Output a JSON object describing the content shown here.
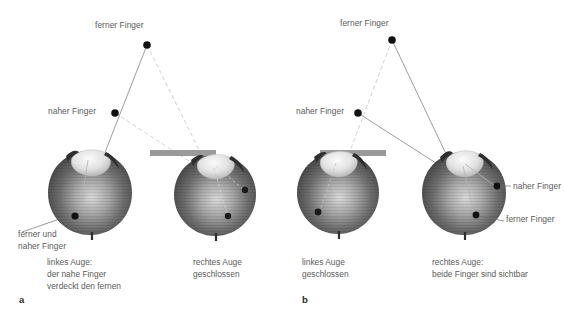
{
  "figure": {
    "background_color": "#ffffff",
    "text_color": "#5b5b5b",
    "letter_color": "#2b2b2b",
    "solid_ray_color": "#8a8a8a",
    "dashed_ray_color": "#c9c9c9",
    "occluder_color": "#9a9a9a",
    "point_color": "#111111"
  },
  "panels": [
    {
      "id": "a",
      "letter": "a",
      "labels": {
        "far_finger": "ferner Finger",
        "near_finger": "naher Finger",
        "retina_note": "ferner und\nnaher Finger"
      },
      "captions": {
        "left_eye": "linkes Auge:\nder nahe Finger\nverdeckt den fernen",
        "right_eye": "rechtes Auge\ngeschlossen"
      },
      "points": {
        "far_finger": {
          "x": 147,
          "y": 45
        },
        "near_finger": {
          "x": 115,
          "y": 113
        }
      },
      "eyes": [
        {
          "name": "left-eye",
          "state": "open",
          "cx": 90,
          "cy": 193
        },
        {
          "name": "right-eye",
          "state": "closed",
          "cx": 215,
          "cy": 195
        }
      ],
      "occluder": {
        "x": 150,
        "y": 150,
        "width": 66,
        "height": 6
      }
    },
    {
      "id": "b",
      "letter": "b",
      "labels": {
        "far_finger": "ferner Finger",
        "near_finger": "naher Finger",
        "retina_near": "naher Finger",
        "retina_far": "ferner Finger"
      },
      "captions": {
        "left_eye": "linkes Auge\ngeschlossen",
        "right_eye": "rechtes Auge:\nbeide Finger sind sichtbar"
      },
      "points": {
        "far_finger": {
          "x": 392,
          "y": 40
        },
        "near_finger": {
          "x": 358,
          "y": 113
        }
      },
      "eyes": [
        {
          "name": "left-eye",
          "state": "closed",
          "cx": 338,
          "cy": 193
        },
        {
          "name": "right-eye",
          "state": "open",
          "cx": 464,
          "cy": 193
        }
      ],
      "occluder": {
        "x": 320,
        "y": 150,
        "width": 66,
        "height": 6
      }
    }
  ]
}
